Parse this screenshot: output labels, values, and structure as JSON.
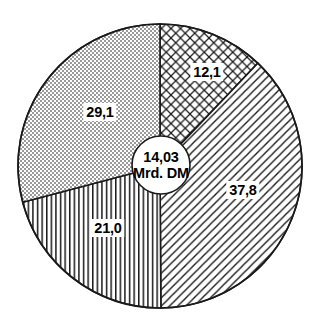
{
  "chart_data": {
    "type": "pie",
    "title": "",
    "subtitle": "",
    "xlabel": "",
    "ylabel": "",
    "legend_position": "none",
    "grid": false,
    "center_label": {
      "value": "14,03",
      "unit": "Mrd. DM"
    },
    "unit_suffix": "%",
    "total": 100.0,
    "start_angle_deg": 0,
    "direction": "clockwise",
    "categories": [
      "12,1",
      "37,8",
      "21,0",
      "29,1"
    ],
    "values": [
      12.1,
      37.8,
      21.0,
      29.1
    ],
    "slices": [
      {
        "label": "12,1",
        "value": 12.1,
        "pattern": "crosshatch",
        "start_deg": 0.0,
        "end_deg": 43.56,
        "label_x": 207,
        "label_y": 72
      },
      {
        "label": "37,8",
        "value": 37.8,
        "pattern": "diagonal-hatch",
        "start_deg": 43.56,
        "end_deg": 179.64,
        "label_x": 243,
        "label_y": 190
      },
      {
        "label": "21,0",
        "value": 21.0,
        "pattern": "vertical-lines",
        "start_deg": 179.64,
        "end_deg": 255.24,
        "label_x": 108,
        "label_y": 228
      },
      {
        "label": "29,1",
        "value": 29.1,
        "pattern": "stipple",
        "start_deg": 255.24,
        "end_deg": 360.0,
        "label_x": 100,
        "label_y": 112
      }
    ],
    "colors": {
      "outline": "#1a1a1a",
      "fill_background": "#ffffff",
      "pattern_ink": "#1a1a1a",
      "stipple_ink": "#8f8f8f",
      "label_text": "#000000",
      "label_background": "#ffffff"
    },
    "geometry": {
      "center_x": 160,
      "center_y": 166,
      "radius": 142,
      "hub_radius": 29
    }
  }
}
